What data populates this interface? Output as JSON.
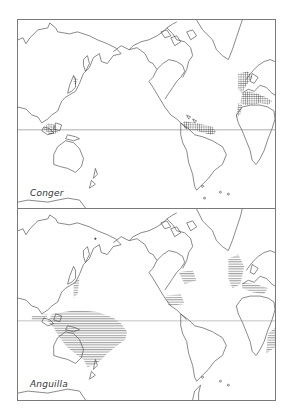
{
  "figure": {
    "panels": [
      {
        "label": "Conger",
        "range_style": "cross-hatched",
        "range_regions": [
          "NE Atlantic / European coast",
          "Mediterranean Sea",
          "Caribbean / northern South America coast",
          "Indonesian archipelago"
        ]
      },
      {
        "label": "Anguilla",
        "range_style": "horizontal-lined",
        "range_regions": [
          "Western Pacific / Indo-Australian region",
          "East Asia coast",
          "North American Atlantic coast",
          "European Atlantic coast",
          "Mediterranean",
          "East Africa coast"
        ]
      }
    ],
    "colors": {
      "line": "#555555",
      "frame": "#7a7a7a",
      "background": "#ffffff"
    }
  }
}
